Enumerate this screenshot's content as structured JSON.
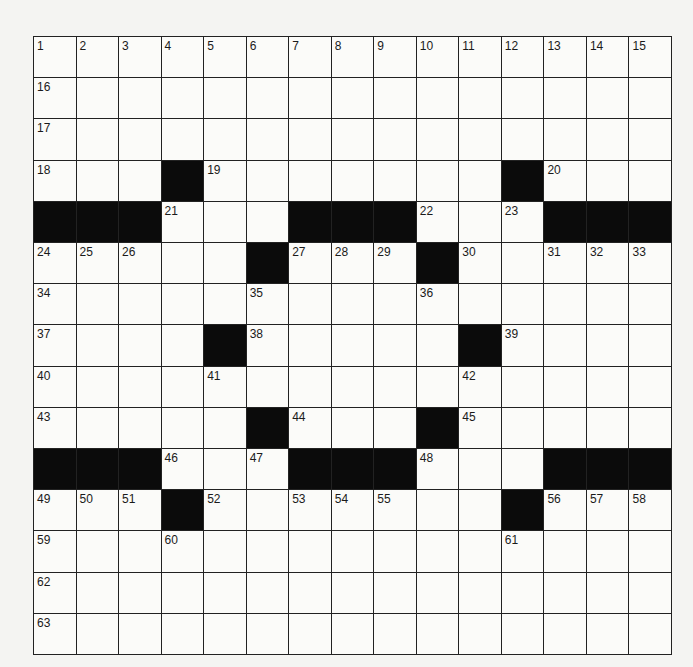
{
  "puzzle": {
    "rows": 15,
    "cols": 15,
    "colors": {
      "block": "#0b0b0b",
      "cell": "#fbfbf9",
      "line": "#222222"
    },
    "grid": [
      "...............",
      "...............",
      "...............",
      "...#.......#...",
      "###...###...###",
      ".....#...#.....",
      "...............",
      "....#.....#....",
      "...............",
      ".....#...#.....",
      "###...###...###",
      "...#.......#...",
      "...............",
      "...............",
      "..............."
    ],
    "numbers": [
      [
        1,
        2,
        3,
        4,
        5,
        6,
        7,
        8,
        9,
        10,
        11,
        12,
        13,
        14,
        15
      ],
      [
        16,
        0,
        0,
        0,
        0,
        0,
        0,
        0,
        0,
        0,
        0,
        0,
        0,
        0,
        0
      ],
      [
        17,
        0,
        0,
        0,
        0,
        0,
        0,
        0,
        0,
        0,
        0,
        0,
        0,
        0,
        0
      ],
      [
        18,
        0,
        0,
        0,
        19,
        0,
        0,
        0,
        0,
        0,
        0,
        0,
        20,
        0,
        0
      ],
      [
        0,
        0,
        0,
        21,
        0,
        0,
        0,
        0,
        0,
        22,
        0,
        23,
        0,
        0,
        0
      ],
      [
        24,
        25,
        26,
        0,
        0,
        0,
        27,
        28,
        29,
        0,
        30,
        0,
        31,
        32,
        33
      ],
      [
        34,
        0,
        0,
        0,
        0,
        35,
        0,
        0,
        0,
        36,
        0,
        0,
        0,
        0,
        0
      ],
      [
        37,
        0,
        0,
        0,
        0,
        38,
        0,
        0,
        0,
        0,
        0,
        39,
        0,
        0,
        0
      ],
      [
        40,
        0,
        0,
        0,
        41,
        0,
        0,
        0,
        0,
        0,
        42,
        0,
        0,
        0,
        0
      ],
      [
        43,
        0,
        0,
        0,
        0,
        0,
        44,
        0,
        0,
        0,
        45,
        0,
        0,
        0,
        0
      ],
      [
        0,
        0,
        0,
        46,
        0,
        47,
        0,
        0,
        0,
        48,
        0,
        0,
        0,
        0,
        0
      ],
      [
        49,
        50,
        51,
        0,
        52,
        0,
        53,
        54,
        55,
        0,
        0,
        0,
        56,
        57,
        58
      ],
      [
        59,
        0,
        0,
        60,
        0,
        0,
        0,
        0,
        0,
        0,
        0,
        61,
        0,
        0,
        0
      ],
      [
        62,
        0,
        0,
        0,
        0,
        0,
        0,
        0,
        0,
        0,
        0,
        0,
        0,
        0,
        0
      ],
      [
        63,
        0,
        0,
        0,
        0,
        0,
        0,
        0,
        0,
        0,
        0,
        0,
        0,
        0,
        0
      ]
    ],
    "entries": [
      [
        "",
        "",
        "",
        "",
        "",
        "",
        "",
        "",
        "",
        "",
        "",
        "",
        "",
        "",
        ""
      ],
      [
        "",
        "",
        "",
        "",
        "",
        "",
        "",
        "",
        "",
        "",
        "",
        "",
        "",
        "",
        ""
      ],
      [
        "",
        "",
        "",
        "",
        "",
        "",
        "",
        "",
        "",
        "",
        "",
        "",
        "",
        "",
        ""
      ],
      [
        "",
        "",
        "",
        "",
        "",
        "",
        "",
        "",
        "",
        "",
        "",
        "",
        "",
        "",
        ""
      ],
      [
        "",
        "",
        "",
        "",
        "",
        "",
        "",
        "",
        "",
        "",
        "",
        "",
        "",
        "",
        ""
      ],
      [
        "",
        "",
        "",
        "",
        "",
        "",
        "",
        "",
        "",
        "",
        "",
        "",
        "",
        "",
        ""
      ],
      [
        "",
        "",
        "",
        "",
        "",
        "",
        "",
        "",
        "",
        "",
        "",
        "",
        "",
        "",
        ""
      ],
      [
        "",
        "",
        "",
        "",
        "",
        "",
        "",
        "",
        "",
        "",
        "",
        "",
        "",
        "",
        ""
      ],
      [
        "",
        "",
        "",
        "",
        "",
        "",
        "",
        "",
        "",
        "",
        "",
        "",
        "",
        "",
        ""
      ],
      [
        "",
        "",
        "",
        "",
        "",
        "",
        "",
        "",
        "",
        "",
        "",
        "",
        "",
        "",
        ""
      ],
      [
        "",
        "",
        "",
        "",
        "",
        "",
        "",
        "",
        "",
        "",
        "",
        "",
        "",
        "",
        ""
      ],
      [
        "",
        "",
        "",
        "",
        "",
        "",
        "",
        "",
        "",
        "",
        "",
        "",
        "",
        "",
        ""
      ],
      [
        "",
        "",
        "",
        "",
        "",
        "",
        "",
        "",
        "",
        "",
        "",
        "",
        "",
        "",
        ""
      ],
      [
        "",
        "",
        "",
        "",
        "",
        "",
        "",
        "",
        "",
        "",
        "",
        "",
        "",
        "",
        ""
      ],
      [
        "",
        "",
        "",
        "",
        "",
        "",
        "",
        "",
        "",
        "",
        "",
        "",
        "",
        "",
        ""
      ]
    ]
  }
}
